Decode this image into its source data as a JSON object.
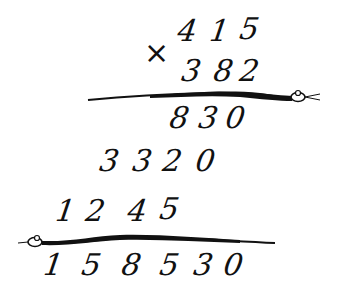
{
  "problem": {
    "operation_symbol": "×",
    "multiplicand": [
      "4",
      "1",
      "5"
    ],
    "multiplier": [
      "3",
      "8",
      "2"
    ],
    "partial_product_1": [
      "8",
      "3",
      "0"
    ],
    "partial_product_2": [
      "3",
      "3",
      "2",
      "0"
    ],
    "partial_product_3": [
      "1",
      "2",
      "4",
      "5"
    ],
    "result": [
      "1",
      "5",
      "8",
      "5",
      "3",
      "0"
    ]
  },
  "decorations": {
    "divider_1": "snake-line",
    "divider_2": "snake-line",
    "ink_color": "#111111"
  }
}
